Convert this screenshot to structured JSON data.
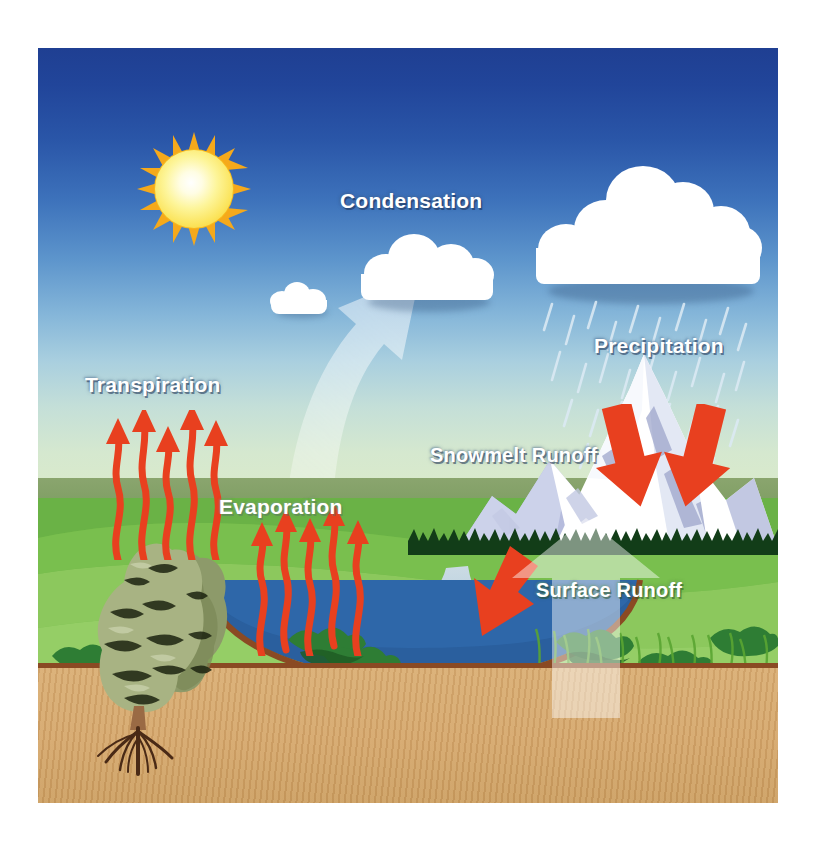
{
  "diagram": {
    "frame": {
      "x": 38,
      "y": 48,
      "width": 740,
      "height": 755
    }
  },
  "labels": {
    "condensation": "Condensation",
    "transpiration": "Transpiration",
    "evaporation": "Evaporation",
    "precipitation": "Precipitation",
    "snowmelt_runoff": "Snowmelt Runoff",
    "surface_runoff": "Surface Runoff"
  },
  "icons": {
    "sun": "sun-icon",
    "small_cloud": "cloud-icon",
    "medium_cloud": "cloud-icon",
    "storm_cloud": "rain-cloud-icon",
    "cycle_arrow": "curved-up-arrow-icon",
    "runoff_arrow": "translucent-up-arrow-icon",
    "mountain": "snow-mountain-icon",
    "tree": "tree-with-roots-icon",
    "rain": "rain-streaks-icon",
    "transpiration_arrows": "red-wavy-up-arrow-icon",
    "evaporation_arrows": "red-wavy-up-arrow-icon",
    "snowmelt_arrows": "red-down-arrow-icon",
    "surface_runoff_arrow": "red-diagonal-down-arrow-icon"
  },
  "colors": {
    "sky_top": "#1f3f92",
    "sky_horizon": "#dcebc9",
    "sun_core": "#fffde4",
    "sun_edge": "#f7c21c",
    "cloud": "#ffffff",
    "grass_light": "#93cd63",
    "grass_dark": "#63b040",
    "soil": "#d2a46a",
    "soil_line": "#8a4a23",
    "water_shallow": "#b7cfdd",
    "water_deep": "#2a5f9e",
    "red_arrow": "#e8401f",
    "label_text": "#ffffff"
  },
  "processes": [
    {
      "name": "Evaporation",
      "direction": "up",
      "medium": "water surface"
    },
    {
      "name": "Transpiration",
      "direction": "up",
      "medium": "vegetation"
    },
    {
      "name": "Condensation",
      "direction": "up",
      "medium": "atmosphere"
    },
    {
      "name": "Precipitation",
      "direction": "down",
      "medium": "cloud"
    },
    {
      "name": "Snowmelt Runoff",
      "direction": "down",
      "medium": "mountain"
    },
    {
      "name": "Surface Runoff",
      "direction": "down-left",
      "medium": "land to river"
    }
  ],
  "counts": {
    "transpiration_arrows": 5,
    "evaporation_arrows": 5,
    "snowmelt_arrows": 2,
    "surface_runoff_arrows": 1,
    "clouds": 3
  }
}
